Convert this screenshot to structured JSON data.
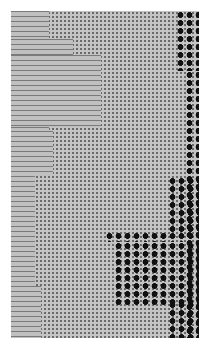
{
  "image": {
    "description": "Abstract halftone pattern: gray field with horizontal striped band on left (stepped edge), fine dot grid, and large black dots along right edge and bottom-right block",
    "colors": {
      "background": "#c4c4c4",
      "lines": "#7a7a7a",
      "small_dots": "#6a6a6a",
      "big_dots": "#111111",
      "page": "#ffffff"
    }
  }
}
